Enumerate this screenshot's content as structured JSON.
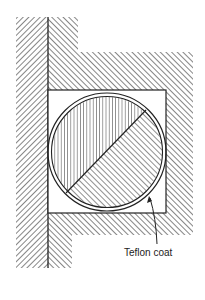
{
  "diagram": {
    "type": "cross-section",
    "labels": [
      {
        "id": "teflon-coat",
        "text": "Teflon coat",
        "x": 124,
        "y": 256
      }
    ],
    "colors": {
      "line": "#222222",
      "background": "#ffffff"
    }
  }
}
